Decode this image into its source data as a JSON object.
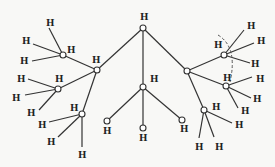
{
  "diagram": {
    "type": "molecular-tree",
    "atom_label": "H",
    "nodes": [
      {
        "id": "top",
        "x": 143,
        "y": 28,
        "label": "H",
        "lx": 140,
        "ly": 20
      },
      {
        "id": "left",
        "x": 97,
        "y": 70,
        "label": "H",
        "lx": 92,
        "ly": 63
      },
      {
        "id": "right",
        "x": 187,
        "y": 71
      },
      {
        "id": "center",
        "x": 143,
        "y": 87,
        "label": "H",
        "lx": 150,
        "ly": 82
      },
      {
        "id": "l1",
        "x": 63,
        "y": 55,
        "label": "H",
        "lx": 67,
        "ly": 53
      },
      {
        "id": "l2",
        "x": 58,
        "y": 89,
        "label": "H",
        "lx": 55,
        "ly": 82
      },
      {
        "id": "l3",
        "x": 82,
        "y": 114,
        "label": "H",
        "lx": 70,
        "ly": 111
      },
      {
        "id": "c1",
        "x": 107,
        "y": 121,
        "label": "H",
        "lx": 103,
        "ly": 134
      },
      {
        "id": "c2",
        "x": 143,
        "y": 128,
        "label": "H",
        "lx": 139,
        "ly": 141
      },
      {
        "id": "c3",
        "x": 182,
        "y": 120,
        "label": "H",
        "lx": 180,
        "ly": 132
      },
      {
        "id": "r1",
        "x": 224,
        "y": 55,
        "label": "H",
        "lx": 214,
        "ly": 48
      },
      {
        "id": "r2",
        "x": 226,
        "y": 86,
        "label": "H",
        "lx": 223,
        "ly": 81
      },
      {
        "id": "r3",
        "x": 204,
        "y": 110,
        "label": "H",
        "lx": 212,
        "ly": 110
      }
    ],
    "bonds": [
      [
        "top",
        "left"
      ],
      [
        "top",
        "center"
      ],
      [
        "top",
        "right"
      ],
      [
        "left",
        "l1"
      ],
      [
        "left",
        "l2"
      ],
      [
        "left",
        "l3"
      ],
      [
        "center",
        "c1"
      ],
      [
        "center",
        "c2"
      ],
      [
        "center",
        "c3"
      ],
      [
        "right",
        "r1"
      ],
      [
        "right",
        "r2"
      ],
      [
        "right",
        "r3"
      ]
    ],
    "terminal_H": [
      {
        "from": "l1",
        "x": 49,
        "y": 28,
        "lx": 46,
        "ly": 26
      },
      {
        "from": "l1",
        "x": 33,
        "y": 44,
        "lx": 22,
        "ly": 44
      },
      {
        "from": "l1",
        "x": 32,
        "y": 61,
        "lx": 20,
        "ly": 64
      },
      {
        "from": "l2",
        "x": 28,
        "y": 79,
        "lx": 17,
        "ly": 82
      },
      {
        "from": "l2",
        "x": 25,
        "y": 95,
        "lx": 12,
        "ly": 101
      },
      {
        "from": "l2",
        "x": 39,
        "y": 110,
        "lx": 27,
        "ly": 116
      },
      {
        "from": "l3",
        "x": 49,
        "y": 122,
        "lx": 38,
        "ly": 128
      },
      {
        "from": "l3",
        "x": 58,
        "y": 137,
        "lx": 47,
        "ly": 145
      },
      {
        "from": "l3",
        "x": 82,
        "y": 147,
        "lx": 78,
        "ly": 158
      },
      {
        "from": "r1",
        "x": 244,
        "y": 30,
        "lx": 247,
        "ly": 29
      },
      {
        "from": "r1",
        "x": 254,
        "y": 43,
        "lx": 257,
        "ly": 44
      },
      {
        "from": "r1",
        "x": 250,
        "y": 63,
        "lx": 251,
        "ly": 67
      },
      {
        "from": "r2",
        "x": 252,
        "y": 77,
        "lx": 256,
        "ly": 82
      },
      {
        "from": "r2",
        "x": 251,
        "y": 98,
        "lx": 253,
        "ly": 102
      },
      {
        "from": "r2",
        "x": 238,
        "y": 108,
        "lx": 241,
        "ly": 114
      },
      {
        "from": "r3",
        "x": 232,
        "y": 123,
        "lx": 235,
        "ly": 128
      },
      {
        "from": "r3",
        "x": 199,
        "y": 138,
        "lx": 195,
        "ly": 150
      },
      {
        "from": "r3",
        "x": 214,
        "y": 137,
        "lx": 215,
        "ly": 150
      }
    ],
    "dashed_arc": {
      "from": "r1",
      "to": "r2"
    }
  }
}
